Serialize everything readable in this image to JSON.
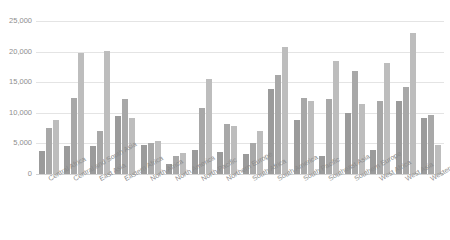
{
  "title_sliver": "",
  "chart_data": {
    "type": "bar",
    "title": "",
    "xlabel": "",
    "ylabel": "",
    "ylim": [
      0,
      25000
    ],
    "yticks": [
      0,
      5000,
      10000,
      15000,
      20000,
      25000
    ],
    "ytick_labels": [
      "0",
      "5,000",
      "10,000",
      "15,000",
      "20,000",
      "25,000"
    ],
    "grid": true,
    "legend": "none",
    "categories": [
      "Central Africa",
      "Central and South Asia",
      "East Asia",
      "Eastern Africa",
      "North Africa",
      "North America",
      "North Pacific",
      "Northern Europe",
      "South Africa",
      "South America",
      "South Pacific",
      "Southeast Asia",
      "Southern Europe",
      "West Africa",
      "West Asia",
      "Western Europe"
    ],
    "series": [
      {
        "name": "Series 1",
        "color": "#9b9b9b",
        "values": [
          3800,
          4500,
          4600,
          9500,
          4700,
          1600,
          4000,
          3600,
          3200,
          13900,
          8800,
          3000,
          10000,
          4000,
          12000,
          9200
        ]
      },
      {
        "name": "Series 2",
        "color": "#a8a8a8",
        "values": [
          7500,
          12500,
          7100,
          12200,
          5100,
          3000,
          10800,
          8200,
          5000,
          16200,
          12500,
          12300,
          16900,
          12000,
          14200,
          9700
        ]
      },
      {
        "name": "Series 3",
        "color": "#bdbdbd",
        "values": [
          8900,
          19800,
          20100,
          9200,
          5400,
          3400,
          15600,
          7900,
          7000,
          20700,
          12000,
          18400,
          11400,
          18200,
          23000,
          4700
        ]
      }
    ]
  }
}
